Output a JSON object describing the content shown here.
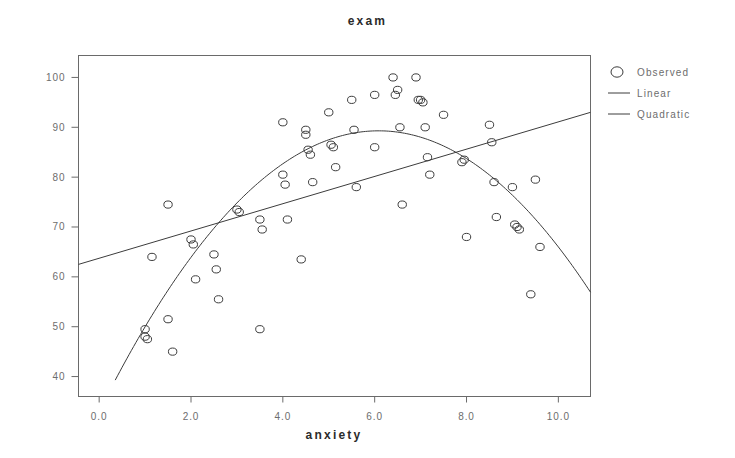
{
  "chart_data": {
    "type": "scatter",
    "title": "exam",
    "xlabel": "anxiety",
    "ylabel": "",
    "xlim": [
      -0.45,
      10.7
    ],
    "ylim": [
      36.0,
      104.4
    ],
    "xticks": [
      0.0,
      2.0,
      4.0,
      6.0,
      8.0,
      10.0
    ],
    "xtick_labels": [
      "0.0",
      "2.0",
      "4.0",
      "6.0",
      "8.0",
      "10.0"
    ],
    "yticks": [
      40,
      50,
      60,
      70,
      80,
      90,
      100
    ],
    "ytick_labels": [
      "40",
      "50",
      "60",
      "70",
      "80",
      "90",
      "100"
    ],
    "grid": false,
    "legend_position": "right-outside",
    "series": [
      {
        "name": "Observed",
        "type": "scatter",
        "marker": "open-circle",
        "color": "#3c3c3c",
        "points": [
          [
            1.0,
            49.5
          ],
          [
            1.0,
            48.0
          ],
          [
            1.05,
            47.5
          ],
          [
            1.15,
            64.0
          ],
          [
            1.5,
            74.5
          ],
          [
            1.5,
            51.5
          ],
          [
            1.6,
            45.0
          ],
          [
            2.0,
            67.5
          ],
          [
            2.05,
            66.5
          ],
          [
            2.1,
            59.5
          ],
          [
            2.5,
            64.5
          ],
          [
            2.55,
            61.5
          ],
          [
            2.6,
            55.5
          ],
          [
            3.0,
            73.5
          ],
          [
            3.05,
            73.0
          ],
          [
            3.5,
            71.5
          ],
          [
            3.5,
            49.5
          ],
          [
            3.55,
            69.5
          ],
          [
            4.0,
            91.0
          ],
          [
            4.0,
            80.5
          ],
          [
            4.05,
            78.5
          ],
          [
            4.1,
            71.5
          ],
          [
            4.4,
            63.5
          ],
          [
            4.5,
            89.5
          ],
          [
            4.5,
            88.5
          ],
          [
            4.55,
            85.5
          ],
          [
            4.6,
            84.5
          ],
          [
            4.65,
            79.0
          ],
          [
            5.0,
            93.0
          ],
          [
            5.05,
            86.5
          ],
          [
            5.1,
            86.0
          ],
          [
            5.15,
            82.0
          ],
          [
            5.5,
            95.5
          ],
          [
            5.55,
            89.5
          ],
          [
            5.6,
            78.0
          ],
          [
            6.0,
            96.5
          ],
          [
            6.0,
            86.0
          ],
          [
            6.4,
            100.0
          ],
          [
            6.45,
            96.5
          ],
          [
            6.5,
            97.5
          ],
          [
            6.55,
            90.0
          ],
          [
            6.6,
            74.5
          ],
          [
            6.9,
            100.0
          ],
          [
            6.95,
            95.5
          ],
          [
            7.0,
            95.5
          ],
          [
            7.05,
            95.0
          ],
          [
            7.1,
            90.0
          ],
          [
            7.15,
            84.0
          ],
          [
            7.2,
            80.5
          ],
          [
            7.5,
            92.5
          ],
          [
            7.9,
            83.0
          ],
          [
            7.95,
            83.5
          ],
          [
            8.0,
            68.0
          ],
          [
            8.5,
            90.5
          ],
          [
            8.55,
            87.0
          ],
          [
            8.6,
            79.0
          ],
          [
            8.65,
            72.0
          ],
          [
            9.0,
            78.0
          ],
          [
            9.05,
            70.5
          ],
          [
            9.1,
            70.0
          ],
          [
            9.15,
            69.5
          ],
          [
            9.4,
            56.5
          ],
          [
            9.5,
            79.5
          ],
          [
            9.6,
            66.0
          ]
        ]
      },
      {
        "name": "Linear",
        "type": "line",
        "color": "#3c3c3c",
        "fit": "y = 62.5 + 2.74 * x",
        "endpoints": [
          [
            -0.45,
            62.5
          ],
          [
            10.7,
            93.0
          ]
        ]
      },
      {
        "name": "Quadratic",
        "type": "line",
        "color": "#3c3c3c",
        "fit": "y = 33.0 + 18.5 * x - 1.52 * x^2",
        "vertex": [
          6.1,
          89.3
        ],
        "x_range": [
          0.35,
          10.7
        ]
      }
    ]
  },
  "legend": {
    "entries": [
      {
        "label": "Observed",
        "symbol": "open-circle"
      },
      {
        "label": "Linear",
        "symbol": "line"
      },
      {
        "label": "Quadratic",
        "symbol": "line"
      }
    ]
  }
}
